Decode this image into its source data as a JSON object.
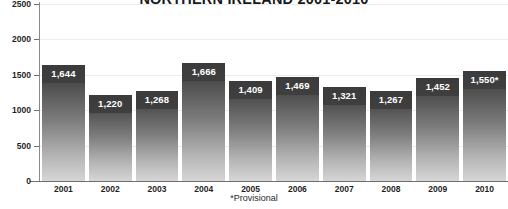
{
  "chart_data": {
    "type": "bar",
    "title": "NORTHERN IRELAND 2001-2010",
    "xlabel": "",
    "ylabel": "",
    "categories": [
      "2001",
      "2002",
      "2003",
      "2004",
      "2005",
      "2006",
      "2007",
      "2008",
      "2009",
      "2010"
    ],
    "values": [
      1644,
      1220,
      1268,
      1666,
      1409,
      1469,
      1321,
      1267,
      1452,
      1550
    ],
    "value_labels": [
      "1,644",
      "1,220",
      "1,268",
      "1,666",
      "1,409",
      "1,469",
      "1,321",
      "1,267",
      "1,452",
      "1,550*"
    ],
    "ylim": [
      0,
      2500
    ],
    "yticks": [
      0,
      500,
      1000,
      1500,
      2000,
      2500
    ],
    "ytick_labels": [
      "0",
      "500",
      "1000",
      "1500",
      "2000",
      "2500"
    ],
    "grid": true,
    "legend": false,
    "annotations": [
      "*Provisional"
    ],
    "bar_color_top": "#3b3b3b",
    "bar_color_bottom": "#d6d6d6",
    "label_box_color": "#3b3b3b",
    "label_text_color": "#ffffff",
    "gridline_color": "#ececec",
    "axis_color": "#6e6e6e"
  },
  "footnote": "*Provisional"
}
